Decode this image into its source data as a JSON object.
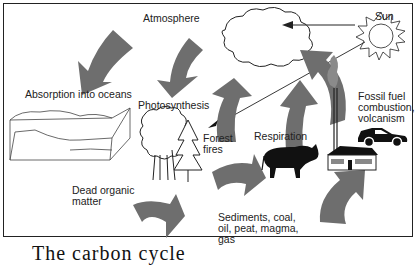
{
  "diagram": {
    "title": "Carbon cycle",
    "labels": {
      "atmosphere": "Atmosphere",
      "sun": "Sun",
      "absorption": "Absorption into oceans",
      "photosynthesis": "Photosynthesis",
      "forest_fires_1": "Forest",
      "forest_fires_2": "fires",
      "respiration": "Respiration",
      "fossil_1": "Fossil fuel",
      "fossil_2": "combustion,",
      "fossil_3": "volcanism",
      "dead_1": "Dead organic",
      "dead_2": "matter",
      "sediments_1": "Sediments, coal,",
      "sediments_2": "oil, peat, magma,",
      "sediments_3": "gas"
    },
    "caption_cut": "The carbon cycle",
    "colors": {
      "arrow_fill": "#6e6e6e",
      "line": "#222222",
      "background": "#ffffff"
    }
  }
}
